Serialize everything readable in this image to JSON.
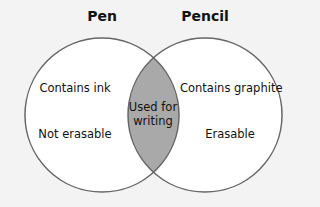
{
  "diagram": {
    "type": "venn",
    "colors": {
      "background": "#f3f3f3",
      "circle_fill": "#ffffff",
      "overlap_fill": "#a9a9a9",
      "stroke": "#666666"
    },
    "sets": [
      {
        "title": "Pen",
        "items": [
          "Contains ink",
          "Not erasable"
        ]
      },
      {
        "title": "Pencil",
        "items": [
          "Contains graphite",
          "Erasable"
        ]
      }
    ],
    "overlap": {
      "line1": "Used for",
      "line2": "writing"
    }
  }
}
